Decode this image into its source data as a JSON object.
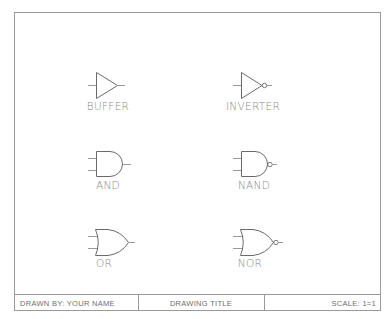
{
  "drawing": {
    "border_color": "#9a9a9a",
    "stroke_color": "#6a6a6a",
    "wire_color": "#9a9a9a"
  },
  "gates": [
    {
      "name": "buffer",
      "label": "BUFFER",
      "type": "buffer",
      "inverted": false
    },
    {
      "name": "inverter",
      "label": "INVERTER",
      "type": "buffer",
      "inverted": true
    },
    {
      "name": "and",
      "label": "AND",
      "type": "and",
      "inverted": false
    },
    {
      "name": "nand",
      "label": "NAND",
      "type": "and",
      "inverted": true
    },
    {
      "name": "or",
      "label": "OR",
      "type": "or",
      "inverted": false
    },
    {
      "name": "nor",
      "label": "NOR",
      "type": "or",
      "inverted": true
    }
  ],
  "title_block": {
    "drawn_by": "DRAWN BY: YOUR NAME",
    "title": "DRAWING TITLE",
    "scale": "SCALE: 1=1"
  }
}
